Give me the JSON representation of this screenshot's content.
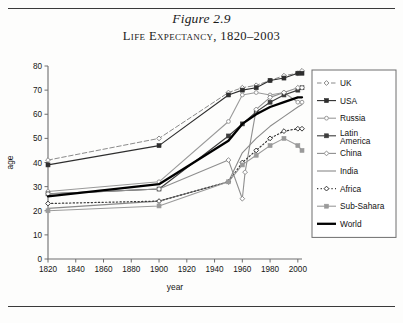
{
  "figure": {
    "number": "Figure 2.9",
    "title": "Life Expectancy, 1820–2003"
  },
  "chart_data": {
    "type": "line",
    "title": "Life Expectancy, 1820–2003",
    "xlabel": "year",
    "ylabel": "age",
    "xlim": [
      1820,
      2003
    ],
    "ylim": [
      0,
      80
    ],
    "xticks": [
      1820,
      1840,
      1860,
      1880,
      1900,
      1920,
      1940,
      1960,
      1980,
      2000
    ],
    "yticks": [
      0,
      10,
      20,
      30,
      40,
      50,
      60,
      70,
      80
    ],
    "grid": false,
    "legend_position": "right",
    "series": [
      {
        "name": "UK",
        "color": "#8a8a8a",
        "style": "dashed",
        "marker": "diamond",
        "x": [
          1820,
          1900,
          1950,
          1960,
          1970,
          1980,
          1990,
          2000,
          2003
        ],
        "values": [
          41,
          50,
          69,
          71,
          72,
          74,
          76,
          77,
          78
        ]
      },
      {
        "name": "USA",
        "color": "#2e2e2e",
        "style": "solid",
        "marker": "square",
        "x": [
          1820,
          1900,
          1950,
          1960,
          1970,
          1980,
          1990,
          2000,
          2003
        ],
        "values": [
          39,
          47,
          68,
          70,
          71,
          74,
          75,
          77,
          77
        ]
      },
      {
        "name": "Russia",
        "color": "#9a9a9a",
        "style": "solid",
        "marker": "circle",
        "x": [
          1820,
          1900,
          1950,
          1960,
          1970,
          1980,
          1990,
          2000,
          2003
        ],
        "values": [
          28,
          32,
          57,
          68,
          69,
          68,
          69,
          65,
          65
        ]
      },
      {
        "name": "Latin America",
        "color": "#3d3d3d",
        "style": "solid",
        "marker": "square",
        "x": [
          1820,
          1900,
          1950,
          1960,
          1970,
          1980,
          1990,
          2000,
          2003
        ],
        "values": [
          27,
          29,
          51,
          56,
          61,
          65,
          68,
          70,
          71
        ]
      },
      {
        "name": "China",
        "color": "#8f8f8f",
        "style": "solid",
        "marker": "diamond",
        "x": [
          1820,
          1900,
          1950,
          1960,
          1962,
          1970,
          1980,
          1990,
          2000,
          2003
        ],
        "values": [
          27,
          29,
          41,
          25,
          36,
          62,
          67,
          69,
          71,
          71
        ]
      },
      {
        "name": "India",
        "color": "#8a8a8a",
        "style": "solid",
        "marker": "none",
        "x": [
          1820,
          1900,
          1950,
          1960,
          1970,
          1980,
          1990,
          2000,
          2003
        ],
        "values": [
          21,
          24,
          32,
          44,
          50,
          55,
          59,
          63,
          64
        ]
      },
      {
        "name": "Africa",
        "color": "#3a3a3a",
        "style": "dotted",
        "marker": "diamond",
        "x": [
          1820,
          1900,
          1950,
          1960,
          1970,
          1980,
          1990,
          2000,
          2003
        ],
        "values": [
          23,
          24,
          32,
          40,
          45,
          50,
          53,
          54,
          54
        ]
      },
      {
        "name": "Sub-Sahara",
        "color": "#9a9a9a",
        "style": "solid",
        "marker": "square",
        "x": [
          1820,
          1900,
          1950,
          1960,
          1970,
          1980,
          1990,
          2000,
          2003
        ],
        "values": [
          20,
          22,
          32,
          39,
          43,
          47,
          50,
          47,
          45
        ]
      },
      {
        "name": "World",
        "color": "#000000",
        "style": "solid-bold",
        "marker": "none",
        "x": [
          1820,
          1900,
          1950,
          1960,
          1970,
          1980,
          1990,
          2000,
          2003
        ],
        "values": [
          26,
          31,
          49,
          56,
          60,
          63,
          65,
          67,
          67
        ]
      }
    ]
  },
  "legend": {
    "items": [
      {
        "label": "UK"
      },
      {
        "label": "USA"
      },
      {
        "label": "Russia"
      },
      {
        "label": "Latin America"
      },
      {
        "label": "China"
      },
      {
        "label": "India"
      },
      {
        "label": "Africa"
      },
      {
        "label": "Sub-Sahara"
      },
      {
        "label": "World"
      }
    ]
  }
}
